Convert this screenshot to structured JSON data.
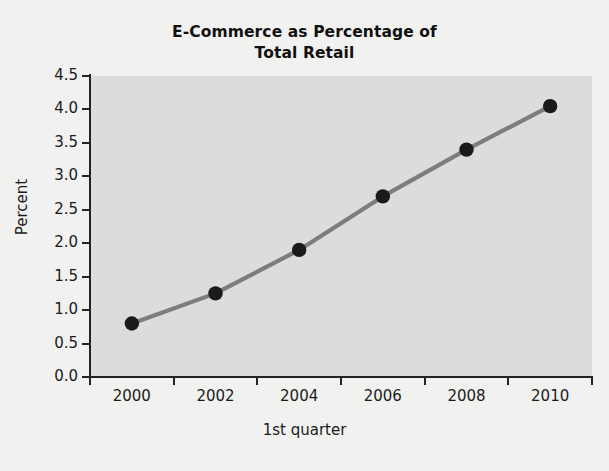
{
  "chart_data": {
    "type": "line",
    "title": "E-Commerce as Percentage of Total Retail",
    "title_lines": [
      "E-Commerce as Percentage of",
      "Total Retail"
    ],
    "xlabel": "1st quarter",
    "ylabel": "Percent",
    "x": [
      2000,
      2002,
      2004,
      2006,
      2008,
      2010
    ],
    "values": [
      0.8,
      1.25,
      1.9,
      2.7,
      3.4,
      4.05
    ],
    "series": [
      {
        "name": "E-Commerce percentage of total retail",
        "values": [
          0.8,
          1.25,
          1.9,
          2.7,
          3.4,
          4.05
        ]
      }
    ],
    "xlim": [
      1999,
      2011
    ],
    "ylim": [
      0.0,
      4.5
    ],
    "xticks": [
      2000,
      2002,
      2004,
      2006,
      2008,
      2010
    ],
    "xtick_labels": [
      "2000",
      "2002",
      "2004",
      "2006",
      "2008",
      "2010"
    ],
    "yticks": [
      0.0,
      0.5,
      1.0,
      1.5,
      2.0,
      2.5,
      3.0,
      3.5,
      4.0,
      4.5
    ],
    "ytick_labels": [
      "0.0",
      "0.5",
      "1.0",
      "1.5",
      "2.0",
      "2.5",
      "3.0",
      "3.5",
      "4.0",
      "4.5"
    ],
    "grid": false,
    "legend": null,
    "legend_position": "none",
    "marker": "filled-circle",
    "colors": {
      "line": "#7d7d7d",
      "marker": "#1a1a1a",
      "plot_background": "#dcdcdc",
      "figure_background": "#f1f1ef",
      "axis": "#222222",
      "text": "#1a1a1a"
    }
  }
}
